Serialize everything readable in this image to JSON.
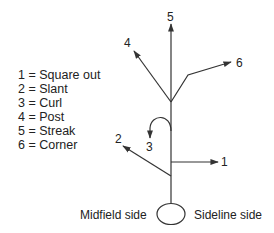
{
  "diagram": {
    "legend": [
      {
        "num": "1",
        "sep": " = ",
        "name": "Square out"
      },
      {
        "num": "2",
        "sep": " = ",
        "name": "Slant"
      },
      {
        "num": "3",
        "sep": " = ",
        "name": "Curl"
      },
      {
        "num": "4",
        "sep": " = ",
        "name": "Post"
      },
      {
        "num": "5",
        "sep": " = ",
        "name": "Streak"
      },
      {
        "num": "6",
        "sep": " = ",
        "name": "Corner"
      }
    ],
    "route_labels": {
      "r1": "1",
      "r2": "2",
      "r3": "3",
      "r4": "4",
      "r5": "5",
      "r6": "6"
    },
    "side_labels": {
      "left": "Midfield side",
      "right": "Sideline side"
    },
    "colors": {
      "line": "#333333",
      "text": "#222222"
    }
  }
}
